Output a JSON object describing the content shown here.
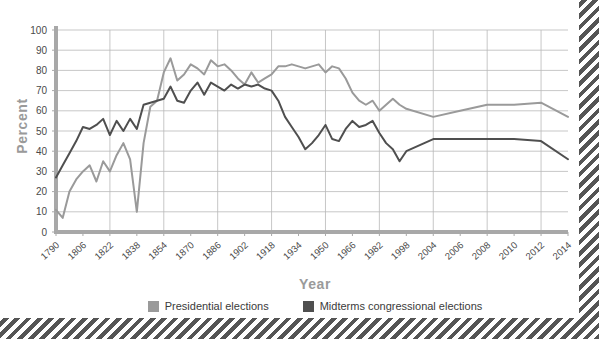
{
  "chart_data": {
    "type": "line",
    "title": "",
    "xlabel": "Year",
    "ylabel": "Percent",
    "ylim": [
      0,
      100
    ],
    "ytick_step": 10,
    "grid": true,
    "legend_position": "bottom-center",
    "xtick_labels": [
      "1790",
      "1806",
      "1822",
      "1838",
      "1854",
      "1870",
      "1886",
      "1902",
      "1918",
      "1934",
      "1950",
      "1966",
      "1982",
      "1998",
      "2004",
      "2006",
      "2008",
      "2010",
      "2012",
      "2014"
    ],
    "ytick_labels": [
      "0",
      "10",
      "20",
      "30",
      "40",
      "50",
      "60",
      "70",
      "80",
      "90",
      "100"
    ],
    "colors": {
      "presidential": "#9a9a9a",
      "midterms": "#4f4f4f",
      "grid": "#b9b9b9",
      "axis": "#a8a8a8",
      "axis_label": "#9a9a9a",
      "tick_text": "#4a4a4a",
      "stripe": "#555555"
    },
    "series": [
      {
        "name": "Presidential elections",
        "color": "#9a9a9a",
        "x": [
          1790,
          1794,
          1798,
          1802,
          1806,
          1810,
          1814,
          1818,
          1822,
          1826,
          1830,
          1834,
          1838,
          1842,
          1846,
          1850,
          1854,
          1858,
          1862,
          1866,
          1870,
          1874,
          1878,
          1882,
          1886,
          1890,
          1894,
          1898,
          1902,
          1906,
          1910,
          1914,
          1918,
          1922,
          1926,
          1930,
          1934,
          1938,
          1942,
          1946,
          1950,
          1954,
          1958,
          1962,
          1966,
          1970,
          1974,
          1978,
          1982,
          1986,
          1990,
          1994,
          1998,
          2004,
          2006,
          2008,
          2010,
          2012,
          2014
        ],
        "values": [
          11,
          7,
          20,
          26,
          30,
          33,
          25,
          35,
          30,
          38,
          44,
          36,
          10,
          44,
          62,
          65,
          79,
          86,
          75,
          78,
          83,
          81,
          78,
          85,
          82,
          83,
          80,
          76,
          73,
          79,
          74,
          76,
          78,
          82,
          82,
          83,
          82,
          81,
          82,
          83,
          79,
          82,
          81,
          76,
          69,
          65,
          63,
          65,
          60,
          63,
          66,
          63,
          61,
          57,
          60,
          63,
          63,
          64,
          57
        ]
      },
      {
        "name": "Midterms congressional elections",
        "color": "#4f4f4f",
        "x": [
          1790,
          1794,
          1798,
          1802,
          1806,
          1810,
          1814,
          1818,
          1822,
          1826,
          1830,
          1834,
          1838,
          1842,
          1846,
          1850,
          1854,
          1858,
          1862,
          1866,
          1870,
          1874,
          1878,
          1882,
          1886,
          1890,
          1894,
          1898,
          1902,
          1906,
          1910,
          1914,
          1918,
          1922,
          1926,
          1930,
          1934,
          1938,
          1942,
          1946,
          1950,
          1954,
          1958,
          1962,
          1966,
          1970,
          1974,
          1978,
          1982,
          1986,
          1990,
          1994,
          1998,
          2004,
          2006,
          2008,
          2010,
          2012,
          2014
        ],
        "values": [
          27,
          33,
          39,
          45,
          52,
          51,
          53,
          56,
          48,
          55,
          50,
          56,
          51,
          63,
          64,
          65,
          66,
          72,
          65,
          64,
          70,
          74,
          68,
          74,
          72,
          70,
          73,
          71,
          73,
          72,
          73,
          71,
          70,
          65,
          57,
          52,
          47,
          41,
          44,
          48,
          53,
          46,
          45,
          51,
          55,
          52,
          53,
          55,
          49,
          44,
          41,
          35,
          40,
          46,
          46,
          46,
          46,
          45,
          36
        ]
      }
    ]
  },
  "axis_titles": {
    "x": "Year",
    "y": "Percent"
  },
  "legend": {
    "items": [
      {
        "label": "Presidential elections",
        "color": "#9a9a9a"
      },
      {
        "label": "Midterms congressional elections",
        "color": "#4f4f4f"
      }
    ]
  }
}
